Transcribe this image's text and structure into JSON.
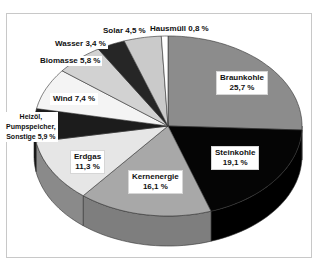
{
  "chart_data": {
    "type": "pie",
    "style": "3d",
    "title": "",
    "unit": "%",
    "categories": [
      "Braunkohle",
      "Steinkohle",
      "Kernenergie",
      "Erdgas",
      "Heizöl, Pumpspeicher, Sonstige",
      "Wind",
      "Biomasse",
      "Wasser",
      "Solar",
      "Hausmüll"
    ],
    "values": [
      25.7,
      19.1,
      16.1,
      11.3,
      5.9,
      7.4,
      5.8,
      3.4,
      4.5,
      0.8
    ],
    "colors": [
      "#8c8c8c",
      "#050505",
      "#a8a8a8",
      "#e6e6e6",
      "#1c1c1c",
      "#f4f4f4",
      "#d2d2d2",
      "#262626",
      "#cacaca",
      "#ffffff"
    ],
    "side_colors": [
      "#6e6e6e",
      "#000000",
      "#7e7e7e",
      "#8a8a8a",
      "#111111",
      "#9a9a9a",
      "#999999",
      "#111111",
      "#909090",
      "#dddddd"
    ],
    "start_angle": "12 o'clock",
    "direction": "clockwise",
    "legend": "none (labels on slices)"
  },
  "labels": {
    "braunkohle": {
      "name": "Braunkohle",
      "value": "25,7 %"
    },
    "steinkohle": {
      "name": "Steinkohle",
      "value": "19,1 %"
    },
    "kernenergie": {
      "name": "Kernenergie",
      "value": "16,1 %"
    },
    "erdgas": {
      "name": "Erdgas",
      "value": "11,3 %"
    },
    "heizoel": {
      "line1": "Heizöl,",
      "line2": "Pumpspeicher,",
      "line3": "Sonstige 5,9 %"
    },
    "wind": {
      "text": "Wind 7,4 %"
    },
    "biomasse": {
      "text": "Biomasse 5,8 %"
    },
    "wasser": {
      "text": "Wasser 3,4 %"
    },
    "solar": {
      "text": "Solar 4,5 %"
    },
    "hausmuell": {
      "text": "Hausmüll 0,8 %"
    }
  }
}
